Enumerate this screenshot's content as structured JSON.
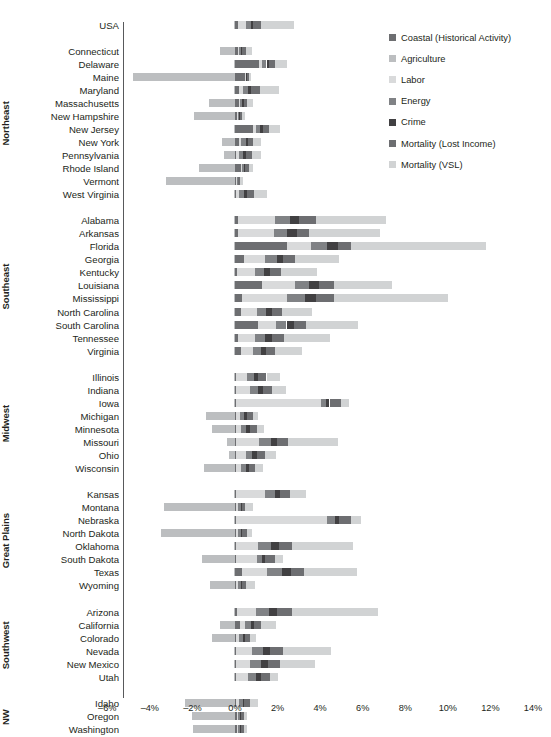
{
  "chart_data": {
    "type": "bar",
    "orientation": "horizontal",
    "stacked": true,
    "title": "",
    "xlabel": "",
    "ylabel": "",
    "xlim": [
      -6,
      14
    ],
    "grid": false,
    "zero_line": true,
    "legend_position": "top-right",
    "tick_labels": [
      "–6%",
      "–4%",
      "–2%",
      "0%",
      "2%",
      "4%",
      "6%",
      "8%",
      "10%",
      "12%",
      "14%"
    ],
    "tick_values": [
      -6,
      -4,
      -2,
      0,
      2,
      4,
      6,
      8,
      10,
      12,
      14
    ],
    "series": [
      {
        "name": "Coastal (Historical Activity)",
        "color": "#6d6e71"
      },
      {
        "name": "Agriculture",
        "color": "#bcbec0"
      },
      {
        "name": "Labor",
        "color": "#d9dadb"
      },
      {
        "name": "Energy",
        "color": "#808285"
      },
      {
        "name": "Crime",
        "color": "#414042"
      },
      {
        "name": "Mortality (Lost Income)",
        "color": "#6d6e71"
      },
      {
        "name": "Mortality (VSL)",
        "color": "#d1d3d4"
      }
    ],
    "groups": [
      {
        "name": "",
        "rows": [
          {
            "label": "USA",
            "values": {
              "Coastal (Historical Activity)": 0.12,
              "Agriculture": -0.06,
              "Labor": 0.42,
              "Energy": 0.22,
              "Crime": 0.1,
              "Mortality (Lost Income)": 0.38,
              "Mortality (VSL)": 1.52
            }
          }
        ]
      },
      {
        "name": "Northeast",
        "rows": [
          {
            "label": "Connecticut",
            "values": {
              "Coastal (Historical Activity)": 0.12,
              "Agriculture": -0.72,
              "Labor": 0.06,
              "Energy": 0.1,
              "Crime": 0.06,
              "Mortality (Lost Income)": 0.2,
              "Mortality (VSL)": 0.28
            }
          },
          {
            "label": "Delaware",
            "values": {
              "Coastal (Historical Activity)": 1.14,
              "Agriculture": -0.04,
              "Labor": 0.12,
              "Energy": 0.22,
              "Crime": 0.1,
              "Mortality (Lost Income)": 0.3,
              "Mortality (VSL)": 0.58
            }
          },
          {
            "label": "Maine",
            "values": {
              "Coastal (Historical Activity)": 0.46,
              "Agriculture": -4.78,
              "Labor": 0.04,
              "Energy": 0.04,
              "Crime": 0.04,
              "Mortality (Lost Income)": 0.06,
              "Mortality (VSL)": 0.1
            }
          },
          {
            "label": "Maryland",
            "values": {
              "Coastal (Historical Activity)": 0.2,
              "Agriculture": -0.06,
              "Labor": 0.16,
              "Energy": 0.26,
              "Crime": 0.14,
              "Mortality (Lost Income)": 0.4,
              "Mortality (VSL)": 0.9
            }
          },
          {
            "label": "Massachusetts",
            "values": {
              "Coastal (Historical Activity)": 0.18,
              "Agriculture": -1.22,
              "Labor": 0.06,
              "Energy": 0.1,
              "Crime": 0.06,
              "Mortality (Lost Income)": 0.18,
              "Mortality (VSL)": 0.26
            }
          },
          {
            "label": "New Hampshire",
            "values": {
              "Coastal (Historical Activity)": 0.08,
              "Agriculture": -1.92,
              "Labor": 0.04,
              "Energy": 0.06,
              "Crime": 0.04,
              "Mortality (Lost Income)": 0.1,
              "Mortality (VSL)": 0.14
            }
          },
          {
            "label": "New Jersey",
            "values": {
              "Coastal (Historical Activity)": 0.86,
              "Agriculture": -0.04,
              "Labor": 0.12,
              "Energy": 0.2,
              "Crime": 0.12,
              "Mortality (Lost Income)": 0.3,
              "Mortality (VSL)": 0.5
            }
          },
          {
            "label": "New York",
            "values": {
              "Coastal (Historical Activity)": 0.2,
              "Agriculture": -0.6,
              "Labor": 0.1,
              "Energy": 0.22,
              "Crime": 0.1,
              "Mortality (Lost Income)": 0.24,
              "Mortality (VSL)": 0.34
            }
          },
          {
            "label": "Pennsylvania",
            "values": {
              "Coastal (Historical Activity)": 0.06,
              "Agriculture": -0.54,
              "Labor": 0.12,
              "Energy": 0.2,
              "Crime": 0.14,
              "Mortality (Lost Income)": 0.3,
              "Mortality (VSL)": 0.38
            }
          },
          {
            "label": "Rhode Island",
            "values": {
              "Coastal (Historical Activity)": 0.28,
              "Agriculture": -1.7,
              "Labor": 0.06,
              "Energy": 0.08,
              "Crime": 0.06,
              "Mortality (Lost Income)": 0.16,
              "Mortality (VSL)": 0.22
            }
          },
          {
            "label": "Vermont",
            "values": {
              "Coastal (Historical Activity)": 0.06,
              "Agriculture": -3.22,
              "Labor": 0.04,
              "Energy": 0.04,
              "Crime": 0.02,
              "Mortality (Lost Income)": 0.06,
              "Mortality (VSL)": 0.16
            }
          },
          {
            "label": "West Virginia",
            "values": {
              "Coastal (Historical Activity)": 0.06,
              "Agriculture": -0.04,
              "Labor": 0.14,
              "Energy": 0.24,
              "Crime": 0.12,
              "Mortality (Lost Income)": 0.34,
              "Mortality (VSL)": 0.62
            }
          }
        ]
      },
      {
        "name": "Southeast",
        "rows": [
          {
            "label": "Alabama",
            "values": {
              "Coastal (Historical Activity)": 0.14,
              "Agriculture": -0.04,
              "Labor": 1.72,
              "Energy": 0.74,
              "Crime": 0.42,
              "Mortality (Lost Income)": 0.8,
              "Mortality (VSL)": 3.26
            }
          },
          {
            "label": "Arkansas",
            "values": {
              "Coastal (Historical Activity)": 0.14,
              "Agriculture": -0.04,
              "Labor": 1.68,
              "Energy": 0.64,
              "Crime": 0.44,
              "Mortality (Lost Income)": 0.58,
              "Mortality (VSL)": 3.34
            }
          },
          {
            "label": "Florida",
            "values": {
              "Coastal (Historical Activity)": 2.46,
              "Agriculture": -0.04,
              "Labor": 1.12,
              "Energy": 0.76,
              "Crime": 0.5,
              "Mortality (Lost Income)": 0.62,
              "Mortality (VSL)": 6.32
            }
          },
          {
            "label": "Georgia",
            "values": {
              "Coastal (Historical Activity)": 0.4,
              "Agriculture": -0.04,
              "Labor": 1.02,
              "Energy": 0.54,
              "Crime": 0.3,
              "Mortality (Lost Income)": 0.58,
              "Mortality (VSL)": 2.04
            }
          },
          {
            "label": "Kentucky",
            "values": {
              "Coastal (Historical Activity)": 0.1,
              "Agriculture": -0.04,
              "Labor": 0.86,
              "Energy": 0.42,
              "Crime": 0.26,
              "Mortality (Lost Income)": 0.54,
              "Mortality (VSL)": 1.68
            }
          },
          {
            "label": "Louisiana",
            "values": {
              "Coastal (Historical Activity)": 1.28,
              "Agriculture": -0.04,
              "Labor": 1.52,
              "Energy": 0.68,
              "Crime": 0.48,
              "Mortality (Lost Income)": 0.7,
              "Mortality (VSL)": 2.72
            }
          },
          {
            "label": "Mississippi",
            "values": {
              "Coastal (Historical Activity)": 0.34,
              "Agriculture": -0.04,
              "Labor": 2.12,
              "Energy": 0.82,
              "Crime": 0.52,
              "Mortality (Lost Income)": 0.84,
              "Mortality (VSL)": 5.38
            }
          },
          {
            "label": "North Carolina",
            "values": {
              "Coastal (Historical Activity)": 0.3,
              "Agriculture": -0.04,
              "Labor": 0.74,
              "Energy": 0.42,
              "Crime": 0.26,
              "Mortality (Lost Income)": 0.48,
              "Mortality (VSL)": 1.42
            }
          },
          {
            "label": "South Carolina",
            "values": {
              "Coastal (Historical Activity)": 1.06,
              "Agriculture": -0.04,
              "Labor": 0.88,
              "Energy": 0.48,
              "Crime": 0.34,
              "Mortality (Lost Income)": 0.58,
              "Mortality (VSL)": 2.42
            }
          },
          {
            "label": "Tennessee",
            "values": {
              "Coastal (Historical Activity)": 0.12,
              "Agriculture": -0.04,
              "Labor": 0.84,
              "Energy": 0.46,
              "Crime": 0.3,
              "Mortality (Lost Income)": 0.56,
              "Mortality (VSL)": 2.18
            }
          },
          {
            "label": "Virginia",
            "values": {
              "Coastal (Historical Activity)": 0.26,
              "Agriculture": -0.04,
              "Labor": 0.6,
              "Energy": 0.36,
              "Crime": 0.22,
              "Mortality (Lost Income)": 0.44,
              "Mortality (VSL)": 1.28
            }
          }
        ]
      },
      {
        "name": "Midwest",
        "rows": [
          {
            "label": "Illinois",
            "values": {
              "Coastal (Historical Activity)": 0.06,
              "Agriculture": -0.04,
              "Labor": 0.52,
              "Energy": 0.3,
              "Crime": 0.22,
              "Mortality (Lost Income)": 0.38,
              "Mortality (VSL)": 0.62
            }
          },
          {
            "label": "Indiana",
            "values": {
              "Coastal (Historical Activity)": 0.06,
              "Agriculture": -0.04,
              "Labor": 0.66,
              "Energy": 0.36,
              "Crime": 0.22,
              "Mortality (Lost Income)": 0.42,
              "Mortality (VSL)": 0.66
            }
          },
          {
            "label": "Iowa",
            "values": {
              "Coastal (Historical Activity)": 0.06,
              "Agriculture": -0.04,
              "Labor": 3.96,
              "Energy": 0.26,
              "Crime": 0.16,
              "Mortality (Lost Income)": 0.52,
              "Mortality (VSL)": 0.38
            }
          },
          {
            "label": "Michigan",
            "values": {
              "Coastal (Historical Activity)": 0.06,
              "Agriculture": -1.36,
              "Labor": 0.16,
              "Energy": 0.2,
              "Crime": 0.14,
              "Mortality (Lost Income)": 0.3,
              "Mortality (VSL)": 0.24
            }
          },
          {
            "label": "Minnesota",
            "values": {
              "Coastal (Historical Activity)": 0.06,
              "Agriculture": -1.06,
              "Labor": 0.22,
              "Energy": 0.26,
              "Crime": 0.16,
              "Mortality (Lost Income)": 0.34,
              "Mortality (VSL)": 0.34
            }
          },
          {
            "label": "Missouri",
            "values": {
              "Coastal (Historical Activity)": 0.06,
              "Agriculture": -0.38,
              "Labor": 1.08,
              "Energy": 0.54,
              "Crime": 0.3,
              "Mortality (Lost Income)": 0.52,
              "Mortality (VSL)": 2.32
            }
          },
          {
            "label": "Ohio",
            "values": {
              "Coastal (Historical Activity)": 0.06,
              "Agriculture": -0.3,
              "Labor": 0.46,
              "Energy": 0.3,
              "Crime": 0.2,
              "Mortality (Lost Income)": 0.4,
              "Mortality (VSL)": 0.5
            }
          },
          {
            "label": "Wisconsin",
            "values": {
              "Coastal (Historical Activity)": 0.06,
              "Agriculture": -1.44,
              "Labor": 0.22,
              "Energy": 0.22,
              "Crime": 0.14,
              "Mortality (Lost Income)": 0.32,
              "Mortality (VSL)": 0.34
            }
          }
        ]
      },
      {
        "name": "Great Plains",
        "rows": [
          {
            "label": "Kansas",
            "values": {
              "Coastal (Historical Activity)": 0.06,
              "Agriculture": -0.04,
              "Labor": 1.36,
              "Energy": 0.44,
              "Crime": 0.26,
              "Mortality (Lost Income)": 0.48,
              "Mortality (VSL)": 0.72
            }
          },
          {
            "label": "Montana",
            "values": {
              "Coastal (Historical Activity)": 0.06,
              "Agriculture": -3.32,
              "Labor": 0.1,
              "Energy": 0.1,
              "Crime": 0.06,
              "Mortality (Lost Income)": 0.14,
              "Mortality (VSL)": 0.4
            }
          },
          {
            "label": "Nebraska",
            "values": {
              "Coastal (Historical Activity)": 0.06,
              "Agriculture": -0.04,
              "Labor": 4.26,
              "Energy": 0.36,
              "Crime": 0.2,
              "Mortality (Lost Income)": 0.56,
              "Mortality (VSL)": 0.5
            }
          },
          {
            "label": "North Dakota",
            "values": {
              "Coastal (Historical Activity)": 0.06,
              "Agriculture": -3.46,
              "Labor": 0.08,
              "Energy": 0.14,
              "Crime": 0.06,
              "Mortality (Lost Income)": 0.22,
              "Mortality (VSL)": 0.22
            }
          },
          {
            "label": "Oklahoma",
            "values": {
              "Coastal (Historical Activity)": 0.06,
              "Agriculture": -0.04,
              "Labor": 1.02,
              "Energy": 0.62,
              "Crime": 0.38,
              "Mortality (Lost Income)": 0.62,
              "Mortality (VSL)": 2.84
            }
          },
          {
            "label": "South Dakota",
            "values": {
              "Coastal (Historical Activity)": 0.06,
              "Agriculture": -1.54,
              "Labor": 0.96,
              "Energy": 0.26,
              "Crime": 0.14,
              "Mortality (Lost Income)": 0.48,
              "Mortality (VSL)": 0.36
            }
          },
          {
            "label": "Texas",
            "values": {
              "Coastal (Historical Activity)": 0.34,
              "Agriculture": -0.04,
              "Labor": 1.18,
              "Energy": 0.7,
              "Crime": 0.42,
              "Mortality (Lost Income)": 0.62,
              "Mortality (VSL)": 2.46
            }
          },
          {
            "label": "Wyoming",
            "values": {
              "Coastal (Historical Activity)": 0.06,
              "Agriculture": -1.16,
              "Labor": 0.08,
              "Energy": 0.14,
              "Crime": 0.06,
              "Mortality (Lost Income)": 0.18,
              "Mortality (VSL)": 0.44
            }
          }
        ]
      },
      {
        "name": "Southwest",
        "rows": [
          {
            "label": "Arizona",
            "values": {
              "Coastal (Historical Activity)": 0.08,
              "Agriculture": -0.04,
              "Labor": 0.9,
              "Energy": 0.62,
              "Crime": 0.38,
              "Mortality (Lost Income)": 0.68,
              "Mortality (VSL)": 4.04
            }
          },
          {
            "label": "California",
            "values": {
              "Coastal (Historical Activity)": 0.22,
              "Agriculture": -0.72,
              "Labor": 0.26,
              "Energy": 0.26,
              "Crime": 0.16,
              "Mortality (Lost Income)": 0.34,
              "Mortality (VSL)": 0.7
            }
          },
          {
            "label": "Colorado",
            "values": {
              "Coastal (Historical Activity)": 0.06,
              "Agriculture": -1.1,
              "Labor": 0.14,
              "Energy": 0.16,
              "Crime": 0.1,
              "Mortality (Lost Income)": 0.24,
              "Mortality (VSL)": 0.28
            }
          },
          {
            "label": "Nevada",
            "values": {
              "Coastal (Historical Activity)": 0.06,
              "Agriculture": -0.04,
              "Labor": 0.74,
              "Energy": 0.52,
              "Crime": 0.34,
              "Mortality (Lost Income)": 0.6,
              "Mortality (VSL)": 2.26
            }
          },
          {
            "label": "New Mexico",
            "values": {
              "Coastal (Historical Activity)": 0.06,
              "Agriculture": -0.04,
              "Labor": 0.66,
              "Energy": 0.5,
              "Crime": 0.32,
              "Mortality (Lost Income)": 0.58,
              "Mortality (VSL)": 1.62
            }
          },
          {
            "label": "Utah",
            "values": {
              "Coastal (Historical Activity)": 0.06,
              "Agriculture": -0.04,
              "Labor": 0.54,
              "Energy": 0.4,
              "Crime": 0.24,
              "Mortality (Lost Income)": 0.42,
              "Mortality (VSL)": 0.36
            }
          }
        ]
      },
      {
        "name": "NW",
        "rows": [
          {
            "label": "Idaho",
            "values": {
              "Coastal (Historical Activity)": 0.06,
              "Agriculture": -2.36,
              "Labor": 0.14,
              "Energy": 0.16,
              "Crime": 0.08,
              "Mortality (Lost Income)": 0.26,
              "Mortality (VSL)": 0.38
            }
          },
          {
            "label": "Oregon",
            "values": {
              "Coastal (Historical Activity)": 0.1,
              "Agriculture": -2.0,
              "Labor": 0.06,
              "Energy": 0.08,
              "Crime": 0.04,
              "Mortality (Lost Income)": 0.12,
              "Mortality (VSL)": 0.18
            }
          },
          {
            "label": "Washington",
            "values": {
              "Coastal (Historical Activity)": 0.1,
              "Agriculture": -1.98,
              "Labor": 0.06,
              "Energy": 0.08,
              "Crime": 0.04,
              "Mortality (Lost Income)": 0.12,
              "Mortality (VSL)": 0.16
            }
          }
        ]
      }
    ]
  },
  "legend": {
    "items": [
      {
        "label": "Coastal (Historical Activity)",
        "color": "#6d6e71"
      },
      {
        "label": "Agriculture",
        "color": "#bcbec0"
      },
      {
        "label": "Labor",
        "color": "#d9dadb"
      },
      {
        "label": "Energy",
        "color": "#808285"
      },
      {
        "label": "Crime",
        "color": "#414042"
      },
      {
        "label": "Mortality (Lost Income)",
        "color": "#6d6e71"
      },
      {
        "label": "Mortality (VSL)",
        "color": "#d1d3d4"
      }
    ]
  }
}
